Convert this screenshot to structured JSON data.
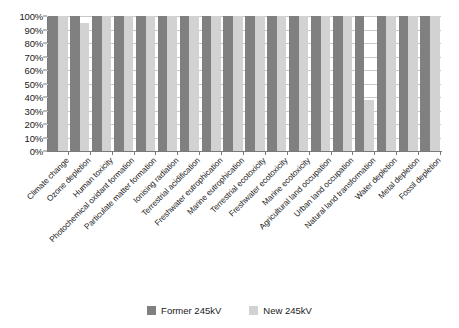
{
  "chart_data": {
    "type": "bar",
    "title": "",
    "xlabel": "",
    "ylabel": "",
    "ylim": [
      0,
      100
    ],
    "grid": true,
    "legend_position": "bottom-center",
    "y_tick_labels": [
      "100%",
      "90%",
      "80%",
      "70%",
      "60%",
      "50%",
      "40%",
      "30%",
      "20%",
      "10%",
      "0%"
    ],
    "y_tick_values": [
      100,
      90,
      80,
      70,
      60,
      50,
      40,
      30,
      20,
      10,
      0
    ],
    "categories": [
      "Climate change",
      "Ozone depletion",
      "Human toxicity",
      "Photochemical oxidant formation",
      "Particulate matter formation",
      "Ionising radiation",
      "Terrestrial acidification",
      "Freshwater eutrophication",
      "Marine eutrophication",
      "Terrestrial ecotoxicity",
      "Freshwater ecotoxicity",
      "Marine ecotoxicity",
      "Agricultural land occupation",
      "Urban land occupation",
      "Natural land transformation",
      "Water depletion",
      "Metal depletion",
      "Fossil depletion"
    ],
    "series": [
      {
        "name": "Former 245kV",
        "color": "#808080",
        "values": [
          100,
          100,
          100,
          100,
          100,
          100,
          100,
          100,
          100,
          100,
          100,
          100,
          100,
          100,
          100,
          100,
          100,
          100
        ]
      },
      {
        "name": "New 245kV",
        "color": "#d2d2d2",
        "values": [
          100,
          95,
          100,
          100,
          100,
          100,
          100,
          100,
          100,
          100,
          100,
          100,
          100,
          100,
          38,
          100,
          100,
          100
        ]
      }
    ]
  },
  "legend": {
    "items": [
      {
        "label": "Former 245kV",
        "color": "#808080",
        "icon": "legend-swatch-icon"
      },
      {
        "label": "New 245kV",
        "color": "#d2d2d2",
        "icon": "legend-swatch-icon"
      }
    ]
  }
}
